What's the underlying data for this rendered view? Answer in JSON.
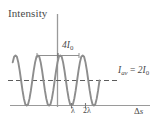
{
  "figure": {
    "axis_label_y": "Intensity",
    "axis_label_x": "Δs",
    "peak_label": "4I₀",
    "average_label": "I_av = 2I₀",
    "tick_labels": [
      "λ",
      "2λ"
    ],
    "curve_color": "#8a8a8a",
    "axis_color": "#9a9a9a",
    "text_color": "#4a4a4a",
    "background": "#ffffff"
  },
  "chart_data": {
    "type": "line",
    "title": "",
    "xlabel": "Δs",
    "ylabel": "Intensity",
    "xlim": [
      -3.2,
      3.6
    ],
    "ylim": [
      0,
      4.6
    ],
    "grid": false,
    "legend": null,
    "function": "I = 4I0 * cos^2(pi * ds / lambda)",
    "x_unit": "lambda",
    "y_unit": "I0",
    "x_tick_values": [
      1,
      2
    ],
    "x_tick_labels": [
      "λ",
      "2λ"
    ],
    "annotations": [
      {
        "text": "4I₀",
        "y_value": 4,
        "note": "peak intensity, maximum of curve"
      },
      {
        "text": "I_av = 2I₀",
        "y_value": 2,
        "note": "average intensity, dashed horizontal line"
      }
    ],
    "series": [
      {
        "name": "Intensity",
        "x": [
          -3.2,
          -3.1,
          -3.0,
          -2.9,
          -2.8,
          -2.7,
          -2.6,
          -2.5,
          -2.4,
          -2.3,
          -2.2,
          -2.1,
          -2.0,
          -1.9,
          -1.8,
          -1.7,
          -1.6,
          -1.5,
          -1.4,
          -1.3,
          -1.2,
          -1.1,
          -1.0,
          -0.9,
          -0.8,
          -0.7,
          -0.6,
          -0.5,
          -0.4,
          -0.3,
          -0.2,
          -0.1,
          0.0,
          0.1,
          0.2,
          0.3,
          0.4,
          0.5,
          0.6,
          0.7,
          0.8,
          0.9,
          1.0,
          1.1,
          1.2,
          1.3,
          1.4,
          1.5,
          1.6,
          1.7,
          1.8,
          1.9,
          2.0,
          2.1,
          2.2,
          2.3,
          2.4,
          2.5,
          2.6,
          2.7,
          2.8,
          2.9,
          3.0
        ],
        "y": [
          3.45,
          3.9,
          4.0,
          3.9,
          3.45,
          2.79,
          2.0,
          1.21,
          0.55,
          0.1,
          0.0,
          0.1,
          0.55,
          1.21,
          2.0,
          2.79,
          3.45,
          3.9,
          4.0,
          3.9,
          3.45,
          2.79,
          2.0,
          1.21,
          0.55,
          0.1,
          0.0,
          0.1,
          0.55,
          1.21,
          2.0,
          2.79,
          3.45,
          3.9,
          4.0,
          3.9,
          3.45,
          2.79,
          2.0,
          1.21,
          0.55,
          0.1,
          0.0,
          0.1,
          0.55,
          1.21,
          2.0,
          2.79,
          3.45,
          3.9,
          4.0,
          3.9,
          3.45,
          2.79,
          2.0,
          1.21,
          0.55,
          0.1,
          0.0,
          0.1,
          0.55,
          1.21,
          2.0
        ]
      },
      {
        "name": "I_av",
        "style": "dashed",
        "constant_y": 2
      }
    ]
  }
}
